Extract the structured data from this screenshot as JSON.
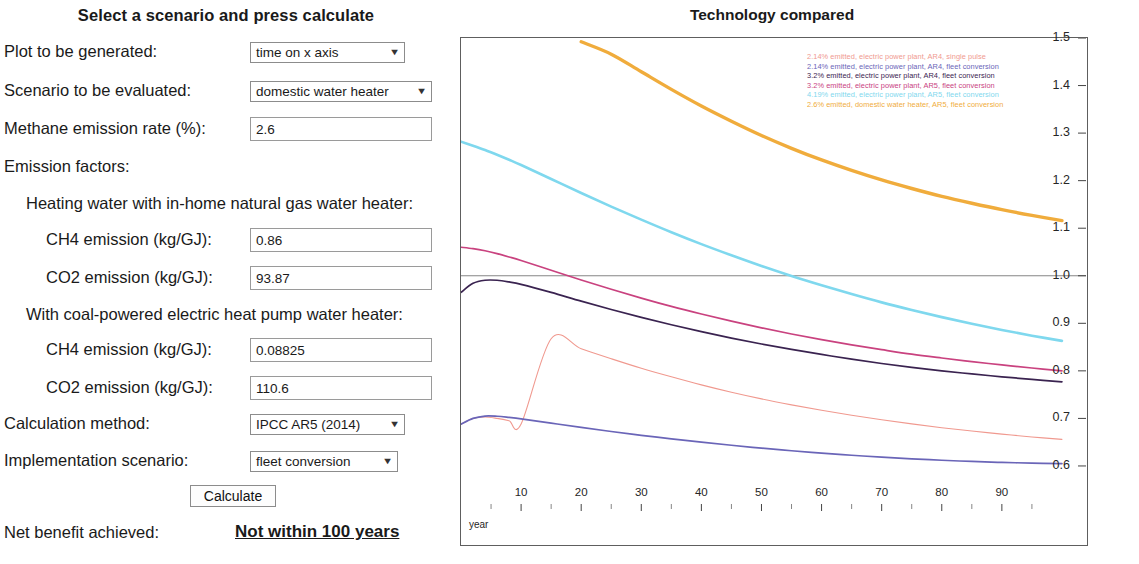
{
  "form": {
    "title": "Select a scenario and press calculate",
    "rows": [
      {
        "label": "Plot to be generated:",
        "control": "select",
        "value": "time on x axis"
      },
      {
        "label": "Scenario to be evaluated:",
        "control": "select",
        "value": "domestic water heater"
      },
      {
        "label": "Methane emission rate (%):",
        "control": "text",
        "value": "2.6"
      },
      {
        "label": "Emission factors:",
        "control": "none",
        "value": ""
      },
      {
        "label": "Heating water with in-home natural gas water heater:",
        "control": "none",
        "value": ""
      },
      {
        "label": "CH4 emission (kg/GJ):",
        "control": "text",
        "value": "0.86"
      },
      {
        "label": "CO2 emission (kg/GJ):",
        "control": "text",
        "value": "93.87"
      },
      {
        "label": "With coal-powered electric heat pump water heater:",
        "control": "none",
        "value": ""
      },
      {
        "label": "CH4 emission (kg/GJ):",
        "control": "text",
        "value": "0.08825"
      },
      {
        "label": "CO2 emission (kg/GJ):",
        "control": "text",
        "value": "110.6"
      },
      {
        "label": "Calculation method:",
        "control": "select",
        "value": "IPCC AR5 (2014)"
      },
      {
        "label": "Implementation scenario:",
        "control": "select",
        "value": "fleet conversion"
      }
    ],
    "calculate_button": "Calculate",
    "result_label": "Net benefit achieved:",
    "result_value": "Not within 100 years",
    "caret_glyph": "▼"
  },
  "chart_data": {
    "type": "line",
    "title": "Technology compared",
    "xlabel": "year",
    "ylabel": "",
    "xlim": [
      0,
      104
    ],
    "ylim": [
      0.52,
      1.5
    ],
    "xticks": [
      10,
      20,
      30,
      40,
      50,
      60,
      70,
      80,
      90
    ],
    "xtick_labels": [
      "10",
      "20",
      "30",
      "40",
      "50",
      "60",
      "70",
      "80",
      "90"
    ],
    "yticks": [
      0.6,
      0.7,
      0.8,
      0.9,
      1.0,
      1.1,
      1.2,
      1.3,
      1.4,
      1.5
    ],
    "ytick_labels": [
      "0.6",
      "0.7",
      "0.8",
      "0.9",
      "1.0",
      "1.1",
      "1.2",
      "1.3",
      "1.4",
      "1.5"
    ],
    "grid": false,
    "reference_line": {
      "y": 1.0,
      "color": "#777777",
      "style": "solid-thin"
    },
    "legend_position": "top-right-inside",
    "x": [
      0,
      2,
      4,
      6,
      8,
      10,
      15,
      20,
      25,
      30,
      35,
      40,
      45,
      50,
      55,
      60,
      65,
      70,
      75,
      80,
      85,
      90,
      95,
      100
    ],
    "series": [
      {
        "name": "2.14% emitted, electric power plant, AR4, single pulse",
        "color": "#f0998f",
        "values": [
          0.688,
          0.7,
          0.703,
          0.7,
          0.695,
          0.688,
          0.8675,
          0.8465,
          0.8255,
          0.8055,
          0.7875,
          0.7705,
          0.755,
          0.741,
          0.7285,
          0.717,
          0.7065,
          0.697,
          0.6885,
          0.6805,
          0.6735,
          0.667,
          0.661,
          0.656
        ]
      },
      {
        "name": "2.14% emitted, electric power plant, AR4, fleet conversion",
        "color": "#6a65b8",
        "values": [
          0.688,
          0.7,
          0.705,
          0.7045,
          0.702,
          0.699,
          0.69,
          0.681,
          0.6725,
          0.6645,
          0.657,
          0.65,
          0.6435,
          0.6375,
          0.632,
          0.627,
          0.6225,
          0.6185,
          0.615,
          0.612,
          0.6095,
          0.6075,
          0.606,
          0.605
        ]
      },
      {
        "name": "3.2% emitted, electric power plant, AR4, fleet conversion",
        "color": "#3a2350",
        "values": [
          0.965,
          0.984,
          0.9905,
          0.9905,
          0.987,
          0.982,
          0.965,
          0.9465,
          0.929,
          0.9125,
          0.897,
          0.8825,
          0.869,
          0.8565,
          0.845,
          0.8345,
          0.8245,
          0.8155,
          0.8075,
          0.8,
          0.7935,
          0.7875,
          0.782,
          0.777
        ]
      },
      {
        "name": "3.2% emitted, electric power plant, AR5, fleet conversion",
        "color": "#c9427f",
        "values": [
          1.06,
          1.057,
          1.0525,
          1.0465,
          1.0395,
          1.032,
          1.0115,
          0.991,
          0.9715,
          0.953,
          0.9355,
          0.9195,
          0.9045,
          0.8905,
          0.8775,
          0.8655,
          0.8545,
          0.8445,
          0.835,
          0.827,
          0.8195,
          0.8125,
          0.806,
          0.8
        ]
      },
      {
        "name": "4.19% emitted, electric power plant, AR5, fleet conversion",
        "color": "#7fd8ee",
        "values": [
          1.282,
          1.2735,
          1.2645,
          1.2545,
          1.244,
          1.233,
          1.2035,
          1.174,
          1.1455,
          1.118,
          1.0915,
          1.0665,
          1.043,
          1.0205,
          0.9995,
          0.98,
          0.9615,
          0.944,
          0.928,
          0.913,
          0.899,
          0.886,
          0.874,
          0.863
        ]
      },
      {
        "name": "2.6% emitted, domestic water heater, AR5, fleet conversion",
        "color": "#f0ac3c",
        "values": [
          null,
          null,
          null,
          null,
          null,
          null,
          null,
          1.492,
          1.466,
          1.429,
          1.392,
          1.357,
          1.325,
          1.295,
          1.268,
          1.2435,
          1.2215,
          1.2015,
          1.1835,
          1.167,
          1.1525,
          1.139,
          1.127,
          1.116
        ]
      }
    ]
  }
}
